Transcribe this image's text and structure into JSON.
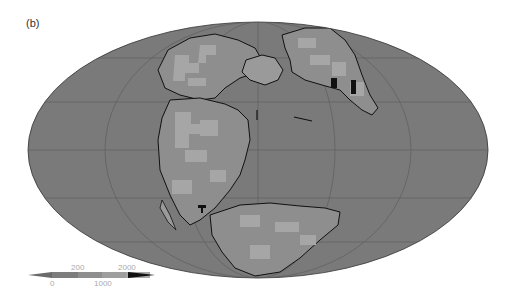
{
  "panel_label": "(b)",
  "map": {
    "projection": "Mollweide (global, paleogeographic reconstruction)",
    "ocean_color": "#7a7a7a",
    "land_low_color": "#9a9a9a",
    "land_mid_color": "#8a8a8a",
    "land_high_color": "#a8a8a8",
    "peak_color": "#111111",
    "coastline_color": "#111111",
    "graticule_color": "#5e5e5e"
  },
  "colorbar": {
    "labels_top": [
      "200",
      "2000"
    ],
    "labels_bottom": [
      "0",
      "1000"
    ],
    "segments": [
      "#7d7d7d",
      "#8e8e8e",
      "#9e9e9e",
      "#aaaaaa"
    ],
    "left_extension_color": "#6a6a6a",
    "right_extension_color": "#111111"
  }
}
